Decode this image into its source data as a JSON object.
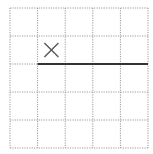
{
  "grid": {
    "rows": 5,
    "cols": 5,
    "origin_x": 10,
    "origin_y": 8,
    "cell_w": 27.6,
    "cell_h": 28,
    "line_color": "#9a9a9a",
    "line_style": "dotted"
  },
  "marks": [
    {
      "type": "x-mark",
      "col": 1,
      "row": 1,
      "color": "#555555"
    }
  ],
  "segments": [
    {
      "type": "wall",
      "from": {
        "col": 1,
        "row": 2
      },
      "to": {
        "col": 5,
        "row": 2
      },
      "color": "#333333",
      "width": 2
    }
  ]
}
